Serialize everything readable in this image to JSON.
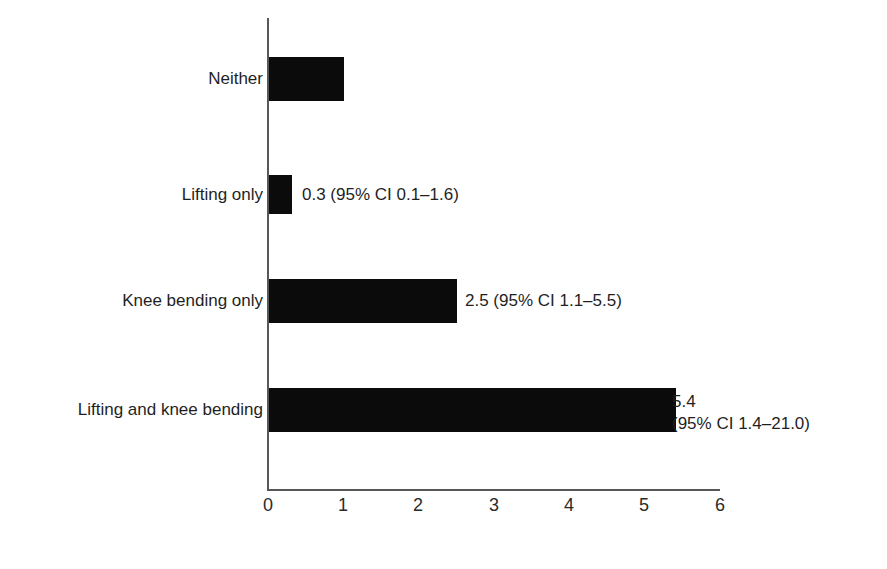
{
  "chart_data": {
    "type": "bar",
    "orientation": "horizontal",
    "title": "",
    "subtitle": "",
    "xlabel": "",
    "ylabel": "",
    "xlim": [
      0,
      6
    ],
    "ylim": null,
    "grid": false,
    "legend": null,
    "bar_color": "#0b0b0b",
    "axis_color": "#58585a",
    "background": "#ffffff",
    "xticks": [
      "0",
      "1",
      "2",
      "3",
      "4",
      "5",
      "6"
    ],
    "xtick_values": [
      0,
      1,
      2,
      3,
      4,
      5,
      6
    ],
    "categories": [
      "Neither",
      "Lifting only",
      "Knee bending only",
      "Lifting and knee bending"
    ],
    "values": [
      1.0,
      0.3,
      2.5,
      5.4
    ],
    "annotations": [
      "",
      "0.3 (95% CI 0.1–1.6)",
      "2.5 (95% CI 1.1–5.5)",
      "5.4\n(95% CI 1.4–21.0)"
    ],
    "points": [
      {
        "category": "Neither",
        "value": 1.0,
        "label_line1": "",
        "label_line2": "",
        "ci_low": null,
        "ci_high": null
      },
      {
        "category": "Lifting only",
        "value": 0.3,
        "label_line1": "0.3 (95% CI 0.1–1.6)",
        "label_line2": "",
        "ci_low": 0.1,
        "ci_high": 1.6
      },
      {
        "category": "Knee bending only",
        "value": 2.5,
        "label_line1": "2.5 (95% CI 1.1–5.5)",
        "label_line2": "",
        "ci_low": 1.1,
        "ci_high": 5.5
      },
      {
        "category": "Lifting and knee bending",
        "value": 5.4,
        "label_line1": "5.4",
        "label_line2": "(95% CI 1.4–21.0)",
        "ci_low": 1.4,
        "ci_high": 21.0
      }
    ]
  },
  "bars": {
    "b0": {
      "label": "Neither",
      "value_text": ""
    },
    "b1": {
      "label": "Lifting only",
      "value_text": "0.3 (95% CI 0.1–1.6)"
    },
    "b2": {
      "label": "Knee bending only",
      "value_text": "2.5 (95% CI 1.1–5.5)"
    },
    "b3": {
      "label": "Lifting and knee bending",
      "value_line1": "5.4",
      "value_line2": "(95% CI 1.4–21.0)"
    }
  },
  "axis": {
    "t0": "0",
    "t1": "1",
    "t2": "2",
    "t3": "3",
    "t4": "4",
    "t5": "5",
    "t6": "6"
  }
}
